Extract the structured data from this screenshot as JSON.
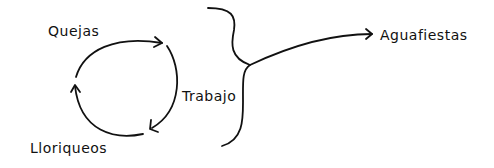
{
  "diagram": {
    "cycle": {
      "nodes": [
        {
          "id": "quejas",
          "label": "Quejas"
        },
        {
          "id": "trabajo",
          "label": "Trabajo"
        },
        {
          "id": "lloriqueos",
          "label": "Lloriqueos"
        }
      ],
      "edges": [
        {
          "from": "quejas",
          "to": "trabajo"
        },
        {
          "from": "trabajo",
          "to": "lloriqueos"
        },
        {
          "from": "lloriqueos",
          "to": "quejas"
        }
      ]
    },
    "brace": {
      "groups": [
        "cycle"
      ]
    },
    "result": {
      "label": "Aguafiestas"
    },
    "stroke_color": "#111111",
    "background_color": "#ffffff"
  }
}
